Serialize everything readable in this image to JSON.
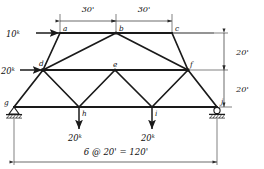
{
  "diagram": {
    "type": "truss-free-body-diagram",
    "title": "",
    "ink_color": "#1a1a1a",
    "background_color": "#ffffff"
  },
  "nodes": [
    {
      "id": "a",
      "label": "a",
      "x": 60,
      "y": 33,
      "label_dx": 3,
      "label_dy": -2
    },
    {
      "id": "b",
      "label": "b",
      "x": 116,
      "y": 33,
      "label_dx": 3,
      "label_dy": -2
    },
    {
      "id": "c",
      "label": "c",
      "x": 172,
      "y": 33,
      "label_dx": 3,
      "label_dy": -2
    },
    {
      "id": "d",
      "label": "d",
      "x": 43,
      "y": 70,
      "label_dx": -1,
      "label_dy": -4
    },
    {
      "id": "e",
      "label": "e",
      "x": 115,
      "y": 70,
      "label_dx": 0,
      "label_dy": -3
    },
    {
      "id": "f",
      "label": "f",
      "x": 188,
      "y": 70,
      "label_dx": 2,
      "label_dy": -3
    },
    {
      "id": "g",
      "label": "g",
      "x": 14,
      "y": 107,
      "label_dx": -8,
      "label_dy": -2
    },
    {
      "id": "h",
      "label": "h",
      "x": 79,
      "y": 107,
      "label_dx": 3,
      "label_dy": 7
    },
    {
      "id": "i",
      "label": "i",
      "x": 152,
      "y": 107,
      "label_dx": 3,
      "label_dy": 7
    },
    {
      "id": "j",
      "label": "j",
      "x": 217,
      "y": 107,
      "label_dx": 4,
      "label_dy": -3
    }
  ],
  "members": [
    {
      "from": "a",
      "to": "b",
      "chord": "top"
    },
    {
      "from": "b",
      "to": "c",
      "chord": "top"
    },
    {
      "from": "d",
      "to": "a",
      "chord": "web"
    },
    {
      "from": "d",
      "to": "b",
      "chord": "web"
    },
    {
      "from": "b",
      "to": "f",
      "chord": "web"
    },
    {
      "from": "c",
      "to": "f",
      "chord": "web"
    },
    {
      "from": "d",
      "to": "e",
      "chord": "middle"
    },
    {
      "from": "e",
      "to": "f",
      "chord": "middle"
    },
    {
      "from": "g",
      "to": "d",
      "chord": "web"
    },
    {
      "from": "d",
      "to": "h",
      "chord": "web"
    },
    {
      "from": "h",
      "to": "e",
      "chord": "web"
    },
    {
      "from": "e",
      "to": "i",
      "chord": "web"
    },
    {
      "from": "i",
      "to": "f",
      "chord": "web"
    },
    {
      "from": "f",
      "to": "j",
      "chord": "web"
    },
    {
      "from": "g",
      "to": "h",
      "chord": "bottom"
    },
    {
      "from": "h",
      "to": "i",
      "chord": "bottom"
    },
    {
      "from": "i",
      "to": "j",
      "chord": "bottom"
    }
  ],
  "loads": [
    {
      "id": "load-a",
      "node": "a",
      "magnitude": "10",
      "unit": "k",
      "text": "10",
      "sup": "k",
      "direction": "right",
      "label_x": 6,
      "label_y": 37
    },
    {
      "id": "load-d",
      "node": "d",
      "magnitude": "20",
      "unit": "k",
      "text": "20",
      "sup": "k",
      "direction": "right",
      "label_x": 1,
      "label_y": 74
    },
    {
      "id": "load-h",
      "node": "h",
      "magnitude": "20",
      "unit": "k",
      "text": "20",
      "sup": "k",
      "direction": "down",
      "label_x": 68,
      "label_y": 139
    },
    {
      "id": "load-i",
      "node": "i",
      "magnitude": "20",
      "unit": "k",
      "text": "20",
      "sup": "k",
      "direction": "down",
      "label_x": 141,
      "label_y": 139
    }
  ],
  "supports": [
    {
      "id": "support-g",
      "node": "g",
      "kind": "pin",
      "label": "g"
    },
    {
      "id": "support-j",
      "node": "j",
      "kind": "roller",
      "label": "j"
    }
  ],
  "dimensions": {
    "top": [
      {
        "id": "dim-ab",
        "text": "30'",
        "from": "a",
        "to": "b",
        "label_x": 88,
        "label_y": 12
      },
      {
        "id": "dim-bc",
        "text": "30'",
        "from": "b",
        "to": "c",
        "label_x": 144,
        "label_y": 12
      }
    ],
    "right": [
      {
        "id": "dim-upper",
        "text": "20'",
        "label_x": 236,
        "label_y": 55
      },
      {
        "id": "dim-lower",
        "text": "20'",
        "label_x": 236,
        "label_y": 92
      }
    ],
    "bottom": {
      "id": "dim-span",
      "text": "6 @ 20' = 120'",
      "label_x": 116,
      "label_y": 158
    }
  }
}
